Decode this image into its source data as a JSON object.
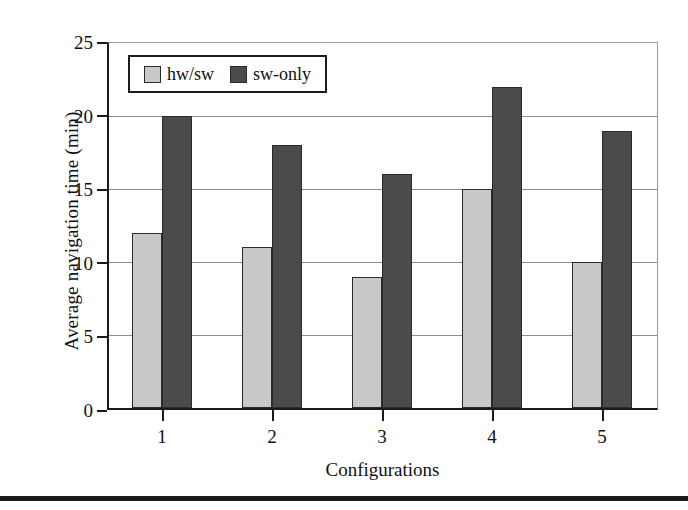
{
  "chart_data": {
    "type": "bar",
    "title": "",
    "xlabel": "Configurations",
    "ylabel": "Average navigation time (min)",
    "categories": [
      "1",
      "2",
      "3",
      "4",
      "5"
    ],
    "series": [
      {
        "name": "hw/sw",
        "color": "#c9c9c9",
        "values": [
          12,
          11,
          9,
          15,
          10
        ]
      },
      {
        "name": "sw-only",
        "color": "#4b4b4b",
        "values": [
          20,
          18,
          16,
          22,
          19
        ]
      }
    ],
    "ylim": [
      0,
      25
    ],
    "yticks": [
      0,
      5,
      10,
      15,
      20,
      25
    ],
    "ytick_labels": [
      "0",
      "5",
      "10",
      "15",
      "20",
      "25"
    ],
    "grid": true,
    "legend_position": "upper left inside"
  },
  "legend": {
    "entries": [
      {
        "label": "hw/sw"
      },
      {
        "label": "sw-only"
      }
    ]
  },
  "axes": {
    "y_title": "Average navigation time (min)",
    "x_title": "Configurations"
  }
}
